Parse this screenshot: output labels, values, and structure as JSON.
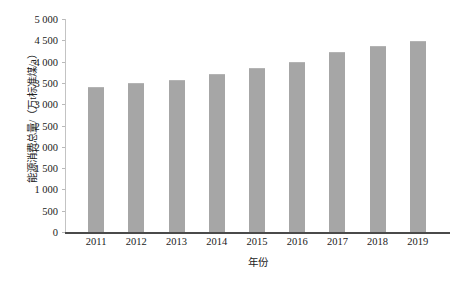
{
  "chart_data": {
    "type": "bar",
    "title": "",
    "subtitle": "",
    "xlabel": "年份",
    "ylabel": "能源消费总量/（万t标准煤/a）",
    "categories": [
      "2011",
      "2012",
      "2013",
      "2014",
      "2015",
      "2016",
      "2017",
      "2018",
      "2019"
    ],
    "values": [
      3400,
      3500,
      3570,
      3710,
      3850,
      3990,
      4225,
      4370,
      4490
    ],
    "series": [
      {
        "name": "能源消费总量",
        "values": [
          3400,
          3500,
          3570,
          3710,
          3850,
          3990,
          4225,
          4370,
          4490
        ]
      }
    ],
    "ylim": [
      0,
      5000
    ],
    "ytick_step": 500,
    "ytick_labels": [
      "5 000",
      "4 500",
      "4 000",
      "3 500",
      "3 000",
      "2 500",
      "2 000",
      "1 500",
      "1 000",
      "500",
      "0"
    ],
    "ytick_values": [
      5000,
      4500,
      4000,
      3500,
      3000,
      2500,
      2000,
      1500,
      1000,
      500,
      0
    ],
    "grid": false,
    "legend": false,
    "legend_position": "none",
    "bar_color": "#a6a6a6",
    "axis_color": "#4a4a4a",
    "background_color": "#ffffff"
  }
}
